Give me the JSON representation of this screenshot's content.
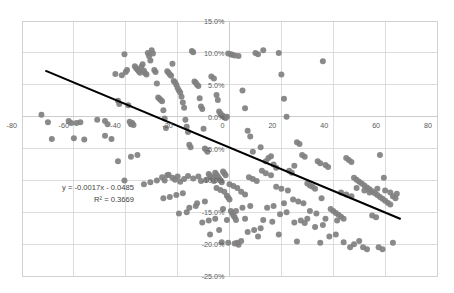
{
  "chart_data": {
    "type": "scatter",
    "title": "",
    "subtitle": "",
    "xlabel": "",
    "ylabel": "",
    "xlim": [
      -80,
      80
    ],
    "ylim": [
      -0.25,
      0.15
    ],
    "grid": true,
    "legend": null,
    "x_ticks": [
      -80,
      -60,
      -40,
      -20,
      0,
      20,
      40,
      60,
      80
    ],
    "x_tick_labels": [
      "-80",
      "-60",
      "-40",
      "-20",
      "0",
      "20",
      "40",
      "60",
      "80"
    ],
    "y_ticks": [
      0.15,
      0.1,
      0.05,
      0.0,
      -0.05,
      -0.1,
      -0.15,
      -0.2,
      -0.25
    ],
    "y_tick_labels": [
      "15.0%",
      "10.0%",
      "5.0%",
      "0.0%",
      "-5.0%",
      "-10.0%",
      "-15.0%",
      "-20.0%",
      "-25.0%"
    ],
    "point_color": "#808080",
    "trendline_color": "#000000",
    "gridline_color": "#d4d4d4",
    "annotations": {
      "equation": "y = -0.0017x - 0.0485",
      "r_squared": "R² = 0.3669"
    },
    "trendline": {
      "slope": -0.0017,
      "intercept": -0.0485,
      "x_start": -71,
      "x_end": 66
    },
    "series": [
      {
        "name": "observations",
        "points": [
          [
            -72.5,
            0.003
          ],
          [
            -70.0,
            -0.009
          ],
          [
            -68.5,
            -0.035
          ],
          [
            -62.0,
            -0.007
          ],
          [
            -61.0,
            -0.01
          ],
          [
            -60.0,
            -0.034
          ],
          [
            -59.0,
            -0.01
          ],
          [
            -57.5,
            -0.009
          ],
          [
            -56.0,
            -0.036
          ],
          [
            -51.0,
            -0.005
          ],
          [
            -48.0,
            -0.007
          ],
          [
            -47.0,
            -0.012
          ],
          [
            -44.0,
            0.067
          ],
          [
            -43.0,
            0.025
          ],
          [
            -42.5,
            0.02
          ],
          [
            -41.5,
            0.065
          ],
          [
            -40.5,
            0.098
          ],
          [
            -40.0,
            0.07
          ],
          [
            -39.5,
            0.073
          ],
          [
            -39.0,
            0.018
          ],
          [
            -38.5,
            -0.008
          ],
          [
            -38.0,
            -0.012
          ],
          [
            -37.5,
            -0.01
          ],
          [
            -37.0,
            -0.013
          ],
          [
            -36.5,
            0.079
          ],
          [
            -36.0,
            0.076
          ],
          [
            -35.5,
            0.074
          ],
          [
            -35.0,
            0.071
          ],
          [
            -34.5,
            0.069
          ],
          [
            -34.0,
            0.078
          ],
          [
            -33.5,
            0.082
          ],
          [
            -33.0,
            0.072
          ],
          [
            -32.5,
            0.068
          ],
          [
            -32.0,
            0.066
          ],
          [
            -31.5,
            0.1
          ],
          [
            -31.0,
            0.095
          ],
          [
            -30.5,
            0.088
          ],
          [
            -30.0,
            0.104
          ],
          [
            -29.5,
            0.099
          ],
          [
            -29.0,
            0.073
          ],
          [
            -28.5,
            0.07
          ],
          [
            -28.0,
            0.052
          ],
          [
            -27.5,
            0.03
          ],
          [
            -27.0,
            0.028
          ],
          [
            -26.5,
            0.026
          ],
          [
            -26.0,
            0.024
          ],
          [
            -25.5,
            0.01
          ],
          [
            -25.0,
            -0.003
          ],
          [
            -24.5,
            -0.018
          ],
          [
            -24.0,
            0.071
          ],
          [
            -23.5,
            0.069
          ],
          [
            -23.0,
            0.066
          ],
          [
            -22.5,
            0.064
          ],
          [
            -22.0,
            0.083
          ],
          [
            -21.5,
            0.056
          ],
          [
            -21.0,
            0.054
          ],
          [
            -20.5,
            0.05
          ],
          [
            -20.0,
            0.045
          ],
          [
            -19.5,
            0.041
          ],
          [
            -19.0,
            0.038
          ],
          [
            -18.5,
            0.031
          ],
          [
            -18.0,
            0.022
          ],
          [
            -17.5,
            0.014
          ],
          [
            -17.0,
            -0.005
          ],
          [
            -16.5,
            -0.016
          ],
          [
            -16.0,
            -0.024
          ],
          [
            -15.5,
            -0.044
          ],
          [
            -15.0,
            -0.048
          ],
          [
            -14.5,
            0.103
          ],
          [
            -14.0,
            0.101
          ],
          [
            -13.5,
            0.055
          ],
          [
            -13.0,
            0.053
          ],
          [
            -12.5,
            0.05
          ],
          [
            -12.0,
            0.048
          ],
          [
            -11.5,
            0.029
          ],
          [
            -11.0,
            0.016
          ],
          [
            -10.5,
            0.012
          ],
          [
            -10.0,
            -0.019
          ],
          [
            -9.5,
            -0.05
          ],
          [
            -9.0,
            -0.052
          ],
          [
            -8.5,
            -0.055
          ],
          [
            -8.0,
            -0.09
          ],
          [
            -7.5,
            -0.093
          ],
          [
            -7.0,
            -0.095
          ],
          [
            -6.5,
            -0.098
          ],
          [
            -6.0,
            -0.101
          ],
          [
            -5.5,
            -0.088
          ],
          [
            -5.0,
            -0.091
          ],
          [
            -4.5,
            -0.094
          ],
          [
            -4.0,
            -0.097
          ],
          [
            -3.5,
            -0.1
          ],
          [
            -3.0,
            -0.103
          ],
          [
            -2.5,
            -0.086
          ],
          [
            -2.0,
            -0.089
          ],
          [
            -1.5,
            -0.092
          ],
          [
            -1.0,
            -0.124
          ],
          [
            -0.5,
            -0.127
          ],
          [
            0.0,
            -0.13
          ],
          [
            0.5,
            -0.148
          ],
          [
            1.0,
            -0.151
          ],
          [
            1.5,
            -0.155
          ],
          [
            2.0,
            -0.158
          ],
          [
            2.5,
            -0.162
          ],
          [
            3.0,
            -0.198
          ],
          [
            3.5,
            -0.201
          ],
          [
            -7.0,
            0.063
          ],
          [
            -6.0,
            0.06
          ],
          [
            -5.0,
            0.034
          ],
          [
            -4.5,
            0.026
          ],
          [
            -4.0,
            0.008
          ],
          [
            -3.5,
            0.005
          ],
          [
            -3.0,
            0.002
          ],
          [
            -2.5,
            0.001
          ],
          [
            -2.0,
            -0.001
          ],
          [
            -1.5,
            -0.002
          ],
          [
            -1.0,
            0.0
          ],
          [
            -0.5,
            0.099
          ],
          [
            0.5,
            0.098
          ],
          [
            1.0,
            0.097
          ],
          [
            2.0,
            0.096
          ],
          [
            3.5,
            0.095
          ],
          [
            5.0,
            0.041
          ],
          [
            6.0,
            0.013
          ],
          [
            7.0,
            -0.022
          ],
          [
            8.0,
            -0.031
          ],
          [
            9.0,
            -0.055
          ],
          [
            10.0,
            0.1
          ],
          [
            11.0,
            0.098
          ],
          [
            12.0,
            -0.048
          ],
          [
            13.0,
            0.104
          ],
          [
            14.0,
            -0.07
          ],
          [
            15.0,
            -0.065
          ],
          [
            16.0,
            -0.062
          ],
          [
            17.0,
            -0.075
          ],
          [
            18.0,
            -0.08
          ],
          [
            19.0,
            0.1
          ],
          [
            20.0,
            0.066
          ],
          [
            21.0,
            0.028
          ],
          [
            22.0,
            0.0
          ],
          [
            23.0,
            -0.085
          ],
          [
            24.0,
            -0.088
          ],
          [
            25.0,
            -0.077
          ],
          [
            26.0,
            -0.04
          ],
          [
            27.0,
            -0.043
          ],
          [
            28.0,
            -0.06
          ],
          [
            29.0,
            -0.063
          ],
          [
            30.0,
            -0.105
          ],
          [
            31.0,
            -0.108
          ],
          [
            32.0,
            -0.11
          ],
          [
            33.0,
            -0.113
          ],
          [
            34.0,
            -0.07
          ],
          [
            35.0,
            -0.073
          ],
          [
            36.0,
            0.087
          ],
          [
            37.0,
            -0.076
          ],
          [
            38.0,
            -0.079
          ],
          [
            39.0,
            -0.145
          ],
          [
            40.0,
            -0.148
          ],
          [
            41.0,
            -0.151
          ],
          [
            42.0,
            -0.154
          ],
          [
            43.0,
            -0.157
          ],
          [
            44.0,
            -0.16
          ],
          [
            45.0,
            -0.065
          ],
          [
            46.0,
            -0.068
          ],
          [
            47.0,
            -0.071
          ],
          [
            48.0,
            -0.096
          ],
          [
            49.0,
            -0.099
          ],
          [
            50.0,
            -0.102
          ],
          [
            51.0,
            -0.105
          ],
          [
            52.0,
            -0.108
          ],
          [
            53.0,
            -0.111
          ],
          [
            54.0,
            -0.114
          ],
          [
            55.0,
            -0.117
          ],
          [
            56.0,
            -0.12
          ],
          [
            57.0,
            -0.123
          ],
          [
            58.0,
            -0.126
          ],
          [
            59.0,
            -0.129
          ],
          [
            60.0,
            -0.132
          ],
          [
            61.0,
            -0.135
          ],
          [
            62.0,
            -0.138
          ],
          [
            63.0,
            -0.125
          ],
          [
            64.0,
            -0.128
          ],
          [
            58.0,
            -0.06
          ],
          [
            59.5,
            -0.096
          ],
          [
            55.0,
            -0.155
          ],
          [
            56.5,
            -0.158
          ],
          [
            50.0,
            -0.195
          ],
          [
            51.5,
            -0.205
          ],
          [
            53.0,
            -0.208
          ],
          [
            48.0,
            -0.2
          ],
          [
            44.0,
            -0.197
          ],
          [
            41.0,
            -0.185
          ],
          [
            38.5,
            -0.188
          ],
          [
            36.0,
            -0.17
          ],
          [
            33.0,
            -0.173
          ],
          [
            30.0,
            -0.16
          ],
          [
            27.5,
            -0.163
          ],
          [
            25.0,
            -0.166
          ],
          [
            22.0,
            -0.15
          ],
          [
            19.5,
            -0.153
          ],
          [
            17.0,
            -0.14
          ],
          [
            14.5,
            -0.143
          ],
          [
            12.0,
            -0.175
          ],
          [
            9.5,
            -0.178
          ],
          [
            7.0,
            -0.181
          ],
          [
            4.5,
            -0.195
          ],
          [
            2.0,
            -0.199
          ],
          [
            -0.5,
            -0.198
          ],
          [
            -3.0,
            -0.197
          ],
          [
            -5.5,
            -0.16
          ],
          [
            -8.0,
            -0.163
          ],
          [
            -10.5,
            -0.166
          ],
          [
            -13.0,
            -0.14
          ],
          [
            -15.5,
            -0.143
          ],
          [
            -18.0,
            -0.12
          ],
          [
            -20.5,
            -0.123
          ],
          [
            -23.0,
            -0.126
          ],
          [
            -25.5,
            -0.128
          ],
          [
            -28.0,
            -0.1
          ],
          [
            -30.5,
            -0.103
          ],
          [
            -33.0,
            -0.106
          ],
          [
            -35.5,
            -0.06
          ],
          [
            -38.0,
            -0.063
          ],
          [
            -40.5,
            -0.1
          ],
          [
            -43.0,
            -0.07
          ],
          [
            -45.5,
            -0.035
          ],
          [
            -48.0,
            -0.03
          ],
          [
            -26.0,
            -0.095
          ],
          [
            -24.0,
            -0.092
          ],
          [
            -22.0,
            -0.096
          ],
          [
            -20.0,
            -0.094
          ],
          [
            -21.0,
            -0.099
          ],
          [
            -23.5,
            -0.091
          ],
          [
            -25.0,
            -0.1
          ],
          [
            -19.0,
            -0.102
          ],
          [
            -17.5,
            -0.098
          ],
          [
            -16.0,
            -0.093
          ],
          [
            -14.0,
            -0.097
          ],
          [
            -12.0,
            -0.094
          ],
          [
            -11.0,
            -0.101
          ],
          [
            -9.0,
            -0.099
          ],
          [
            -6.5,
            -0.096
          ],
          [
            -5.0,
            -0.112
          ],
          [
            -3.5,
            -0.115
          ],
          [
            -2.0,
            -0.118
          ],
          [
            0.0,
            -0.106
          ],
          [
            1.5,
            -0.109
          ],
          [
            3.0,
            -0.112
          ],
          [
            4.5,
            -0.118
          ],
          [
            6.0,
            -0.122
          ],
          [
            7.5,
            -0.095
          ],
          [
            9.0,
            -0.098
          ],
          [
            10.5,
            -0.101
          ],
          [
            12.5,
            -0.085
          ],
          [
            14.0,
            -0.089
          ],
          [
            16.0,
            -0.092
          ],
          [
            18.0,
            -0.11
          ],
          [
            20.0,
            -0.113
          ],
          [
            22.5,
            -0.116
          ],
          [
            24.5,
            -0.13
          ],
          [
            26.5,
            -0.133
          ],
          [
            28.5,
            -0.136
          ],
          [
            31.0,
            -0.148
          ],
          [
            33.5,
            -0.152
          ],
          [
            35.5,
            -0.128
          ],
          [
            43.0,
            -0.119
          ],
          [
            45.0,
            -0.122
          ],
          [
            47.0,
            -0.125
          ],
          [
            49.0,
            -0.112
          ],
          [
            52.0,
            -0.116
          ],
          [
            54.0,
            -0.119
          ],
          [
            57.0,
            -0.113
          ],
          [
            60.0,
            -0.116
          ],
          [
            62.0,
            -0.119
          ],
          [
            64.5,
            -0.121
          ],
          [
            57.5,
            -0.205
          ],
          [
            59.0,
            -0.208
          ],
          [
            63.0,
            -0.198
          ],
          [
            46.5,
            -0.205
          ],
          [
            35.0,
            -0.198
          ],
          [
            26.0,
            -0.196
          ],
          [
            19.0,
            -0.185
          ],
          [
            11.0,
            -0.188
          ],
          [
            6.0,
            -0.16
          ],
          [
            -1.0,
            -0.162
          ],
          [
            -7.5,
            -0.185
          ],
          [
            -4.0,
            -0.178
          ],
          [
            8.0,
            -0.14
          ],
          [
            5.0,
            -0.143
          ],
          [
            -9.5,
            -0.133
          ],
          [
            -12.5,
            -0.136
          ],
          [
            21.0,
            -0.136
          ],
          [
            29.0,
            -0.167
          ],
          [
            37.0,
            -0.16
          ],
          [
            41.5,
            -0.163
          ],
          [
            13.0,
            -0.162
          ],
          [
            16.5,
            -0.165
          ],
          [
            -16.5,
            -0.15
          ],
          [
            -19.5,
            -0.152
          ],
          [
            2.5,
            -0.148
          ],
          [
            -2.5,
            -0.145
          ]
        ]
      }
    ]
  }
}
